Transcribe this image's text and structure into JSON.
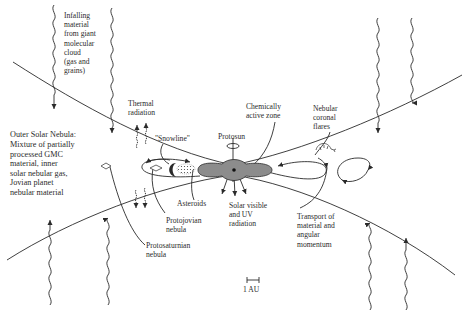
{
  "figure": {
    "type": "schematic diagram of the early solar nebula",
    "labels": {
      "infalling": "Infalling\nmaterial\nfrom giant\nmolecular\ncloud\n(gas and\ngrains)",
      "thermal": "Thermal\nradiation",
      "chemically_active": "Chemically\nactive zone",
      "coronal_flares": "Nebular\ncoronal\nflares",
      "outer_nebula_title": "Outer Solar Nebula:",
      "outer_nebula_desc": "Mixture of partially\nprocessed GMC\nmaterial, inner\nsolar nebular gas,\nJovian planet\nnebular material",
      "snowline": "\"Snowline\"",
      "protosun": "Protosun",
      "asteroids": "Asteroids",
      "solar_radiation": "Solar visible\nand UV\nradiation",
      "protojovian": "Protojovian\nnebula",
      "transport": "Transport of\nmaterial and\nangular\nmomentum",
      "protosaturnian": "Protosaturnian\nnebula",
      "scale": "1 AU"
    },
    "colors": {
      "ink": "#2a2a2a",
      "protosun_fill": "#8c8c8c",
      "background": "#ffffff"
    }
  }
}
